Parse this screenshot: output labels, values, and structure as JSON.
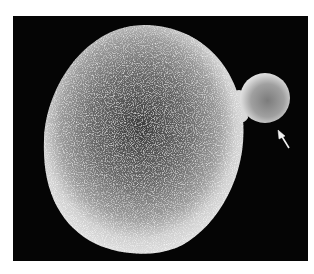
{
  "figure": {
    "description": "Scanning electron micrograph of a budding yeast cell",
    "background_color": "#050505",
    "frame_color": "#ffffff",
    "main_cell": {
      "label": "mother cell"
    },
    "bud": {
      "label": "bud"
    },
    "arrow": {
      "label": "arrow pointing to bud",
      "color": "#f2f2f2"
    }
  }
}
